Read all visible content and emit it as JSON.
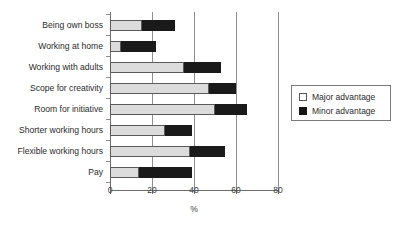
{
  "chart_data": {
    "type": "bar",
    "orientation": "horizontal",
    "stacked": true,
    "title": "",
    "xlabel": "%",
    "ylabel": "",
    "xlim": [
      0,
      80
    ],
    "xticks": [
      0,
      20,
      40,
      60,
      80
    ],
    "xtick_labels": [
      "0",
      "20",
      "40",
      "60",
      "80"
    ],
    "grid": "vertical",
    "legend_position": "right",
    "categories": [
      "Being own boss",
      "Working at home",
      "Working with adults",
      "Scope for creativity",
      "Room for initiative",
      "Shorter working hours",
      "Flexible working hours",
      "Pay"
    ],
    "series": [
      {
        "name": "Major advantage",
        "color": "#dcdcdc",
        "values": [
          15,
          5,
          35,
          47,
          50,
          26,
          38,
          14
        ]
      },
      {
        "name": "Minor advantage",
        "color": "#1a1a1a",
        "values": [
          16,
          17,
          18,
          13,
          15,
          13,
          17,
          25
        ]
      }
    ],
    "totals": [
      31,
      22,
      53,
      60,
      65,
      39,
      55,
      39
    ]
  },
  "legend": {
    "entries": [
      {
        "label": "Major advantage",
        "swatch": "major-advantage-swatch"
      },
      {
        "label": "Minor advantage",
        "swatch": "minor-advantage-swatch"
      }
    ]
  },
  "axis": {
    "x_title": "%"
  }
}
